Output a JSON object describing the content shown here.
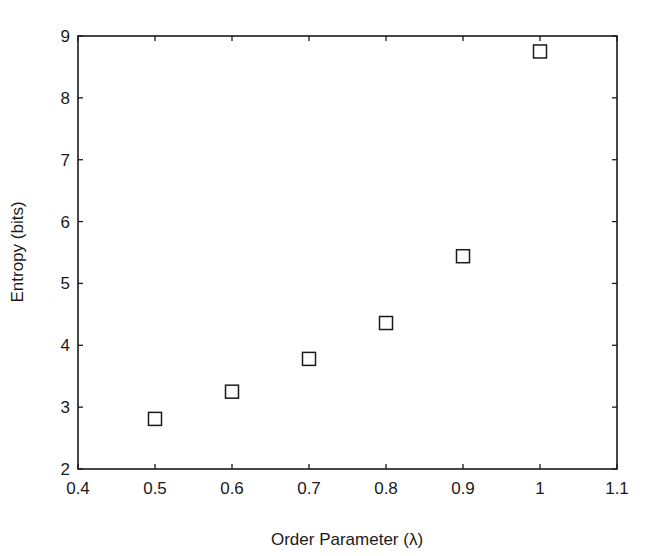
{
  "chart_data": {
    "type": "scatter",
    "title": "",
    "xlabel": "Order Parameter (λ)",
    "ylabel": "Entropy (bits)",
    "xlim": [
      0.4,
      1.1
    ],
    "ylim": [
      2,
      9
    ],
    "xticks": [
      "0.4",
      "0.5",
      "0.6",
      "0.7",
      "0.8",
      "0.9",
      "1",
      "1.1"
    ],
    "yticks": [
      "2",
      "3",
      "4",
      "5",
      "6",
      "7",
      "8",
      "9"
    ],
    "grid": false,
    "legend": null,
    "marker": "square",
    "series": [
      {
        "name": "entropy",
        "x": [
          0.5,
          0.6,
          0.7,
          0.8,
          0.9,
          1.0
        ],
        "y": [
          2.81,
          3.25,
          3.78,
          4.36,
          5.44,
          8.75
        ]
      }
    ]
  },
  "colors": {
    "axis": "#1a1a1a",
    "marker": "#1a1a1a",
    "background": "#ffffff"
  }
}
